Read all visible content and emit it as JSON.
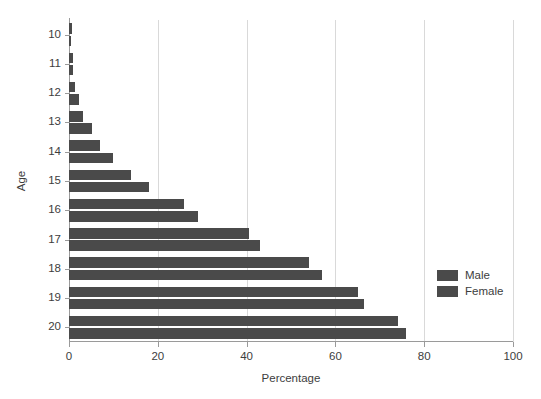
{
  "chart_data": {
    "type": "bar",
    "orientation": "horizontal",
    "title": "",
    "xlabel": "Percentage",
    "ylabel": "Age",
    "categories": [
      "10",
      "11",
      "12",
      "13",
      "14",
      "15",
      "16",
      "17",
      "18",
      "19",
      "20"
    ],
    "series": [
      {
        "name": "Male",
        "color": "#4a4a4a",
        "values": [
          0.7,
          1.0,
          1.4,
          3.2,
          7.0,
          14.0,
          26.0,
          40.5,
          54.0,
          65.0,
          74.0
        ]
      },
      {
        "name": "Female",
        "color": "#4a4a4a",
        "values": [
          0.5,
          0.8,
          2.3,
          5.2,
          10.0,
          18.0,
          29.0,
          43.0,
          57.0,
          66.5,
          76.0
        ]
      }
    ],
    "xlim": [
      0,
      100
    ],
    "xticks": [
      0,
      20,
      40,
      60,
      80,
      100
    ],
    "xticklabels": [
      "0",
      "20",
      "40",
      "60",
      "80",
      "100"
    ],
    "grid": "vertical",
    "legend_position": "right",
    "legend_entries": [
      "Male",
      "Female"
    ]
  },
  "colors": {
    "bar": "#4a4a4a",
    "gridline": "#d9d9d9",
    "axis": "#9a9a9a",
    "text": "#3d3d3d",
    "background": "#ffffff"
  }
}
